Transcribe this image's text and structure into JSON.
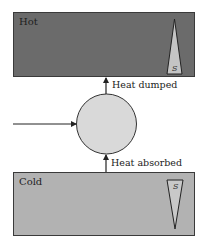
{
  "diagram": {
    "hot_reservoir": {
      "label": "Hot",
      "fill": "#6b6b6b",
      "entropy_symbol": "S",
      "entropy_triangle": "pointing-up"
    },
    "cold_reservoir": {
      "label": "Cold",
      "fill": "#b2b2b2",
      "entropy_symbol": "S",
      "entropy_triangle": "pointing-down"
    },
    "engine": {
      "shape": "circle",
      "fill": "#d9d9d9"
    },
    "arrows": {
      "work_in": {
        "direction": "right",
        "from": "left-edge",
        "to": "engine"
      },
      "heat_dumped": {
        "label": "Heat dumped",
        "direction": "up",
        "from": "engine",
        "to": "hot_reservoir"
      },
      "heat_absorbed": {
        "label": "Heat absorbed",
        "direction": "up",
        "from": "cold_reservoir",
        "to": "engine"
      }
    }
  }
}
